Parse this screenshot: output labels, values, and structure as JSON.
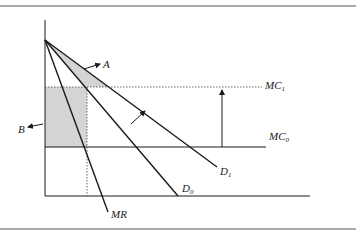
{
  "diagram": {
    "type": "economics-monopoly-demand-shift",
    "colors": {
      "line": "#1a1a1a",
      "rule": "#555555",
      "shade": "#d4d4d4",
      "dotted": "#666666"
    },
    "labels": {
      "A": "A",
      "B": "B",
      "MC1_main": "MC",
      "MC1_sub": "1",
      "MC0_main": "MC",
      "MC0_sub": "0",
      "D1_main": "D",
      "D1_sub": "1",
      "D0_main": "D",
      "D0_sub": "0",
      "MR": "MR"
    },
    "curves": [
      {
        "name": "D1",
        "from": [
          45,
          40
        ],
        "to": [
          217,
          167
        ]
      },
      {
        "name": "D0",
        "from": [
          45,
          40
        ],
        "to": [
          178,
          196
        ]
      },
      {
        "name": "MR",
        "from": [
          45,
          40
        ],
        "to": [
          108,
          212
        ]
      },
      {
        "name": "MC0",
        "y": 147,
        "x_from": 45,
        "x_to": 266,
        "style": "solid"
      },
      {
        "name": "MC1",
        "y": 87,
        "x_from": 45,
        "x_to": 262,
        "style": "dotted"
      }
    ],
    "shaded_regions": [
      {
        "name": "A",
        "shape": "triangle between D0 and D1 above MC1"
      },
      {
        "name": "B",
        "shape": "rectangle between MC0 and MC1 left of quantity"
      }
    ],
    "arrows": [
      {
        "name": "MC shift up",
        "from": [
          222,
          147
        ],
        "to": [
          222,
          89
        ]
      },
      {
        "name": "demand shift out",
        "from": [
          131,
          124
        ],
        "to": [
          145,
          111
        ]
      },
      {
        "name": "A pointer",
        "from": [
          84,
          69
        ],
        "to": [
          99,
          64
        ]
      },
      {
        "name": "B pointer",
        "from": [
          43,
          124
        ],
        "to": [
          28,
          127
        ]
      }
    ]
  }
}
